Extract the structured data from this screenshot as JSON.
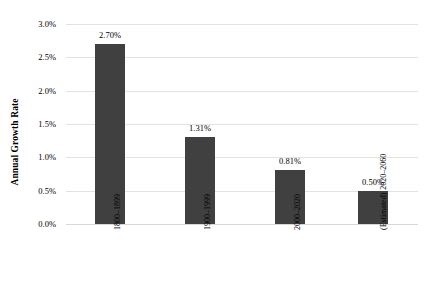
{
  "chart_data": {
    "type": "bar",
    "title": "",
    "xlabel": "",
    "ylabel": "Annual Growth Rate",
    "categories": [
      "1800–1899",
      "1900–1999",
      "2000–2020",
      "2020–2060 (Estimated)"
    ],
    "category_lines": [
      [
        "1800–1899"
      ],
      [
        "1900–1999"
      ],
      [
        "2000–2020"
      ],
      [
        "2020–2060",
        "(Estimated)"
      ]
    ],
    "values": [
      2.7,
      1.31,
      0.81,
      0.5
    ],
    "value_labels": [
      "2.70%",
      "1.31%",
      "0.81%",
      "0.50%"
    ],
    "ylim": [
      0.0,
      3.0
    ],
    "y_ticks": [
      0.0,
      0.5,
      1.0,
      1.5,
      2.0,
      2.5,
      3.0
    ],
    "y_tick_labels": [
      "0.0%",
      "0.5%",
      "1.0%",
      "1.5%",
      "2.0%",
      "2.5%",
      "3.0%"
    ],
    "grid": true,
    "legend": false,
    "bar_color": "#404040",
    "gridline_color": "#e3e3e3",
    "background_color": "#ffffff"
  }
}
